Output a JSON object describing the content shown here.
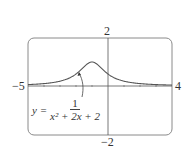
{
  "chart_data": {
    "type": "line",
    "title": "",
    "xlabel": "",
    "ylabel": "",
    "xlim": [
      -5,
      4
    ],
    "ylim": [
      -2,
      2
    ],
    "tick_labels": {
      "x_min": "−5",
      "x_max": "4",
      "y_max": "2",
      "y_min": "−2"
    },
    "grid": false,
    "series": [
      {
        "name": "y = 1/(x^2 + 2x + 2)",
        "x": [
          -5,
          -4,
          -3,
          -2,
          -1.5,
          -1,
          -0.5,
          0,
          1,
          2,
          3,
          4
        ],
        "y": [
          0.059,
          0.1,
          0.2,
          0.5,
          0.8,
          1.0,
          0.8,
          0.5,
          0.2,
          0.1,
          0.059,
          0.038
        ]
      }
    ],
    "annotations": [
      {
        "text_prefix": "y =",
        "numerator": "1",
        "denominator": "x² + 2x + 2",
        "arrow_to": [
          -1.4,
          0.7
        ]
      }
    ],
    "colors": {
      "curve": "#555555",
      "axes": "#555555",
      "frame": "#888888"
    }
  },
  "labels": {
    "x_min": "−5",
    "x_max": "4",
    "y_max": "2",
    "y_min": "−2",
    "formula_prefix": "y =",
    "formula_num": "1",
    "formula_den": "x² + 2x + 2"
  }
}
